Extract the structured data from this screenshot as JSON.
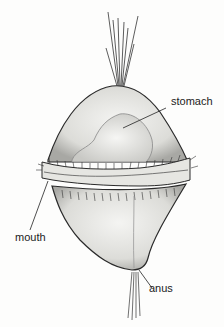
{
  "figure": {
    "labels": [
      {
        "id": "stomach",
        "text": "stomach"
      },
      {
        "id": "mouth",
        "text": "mouth"
      },
      {
        "id": "anus",
        "text": "anus"
      }
    ]
  }
}
